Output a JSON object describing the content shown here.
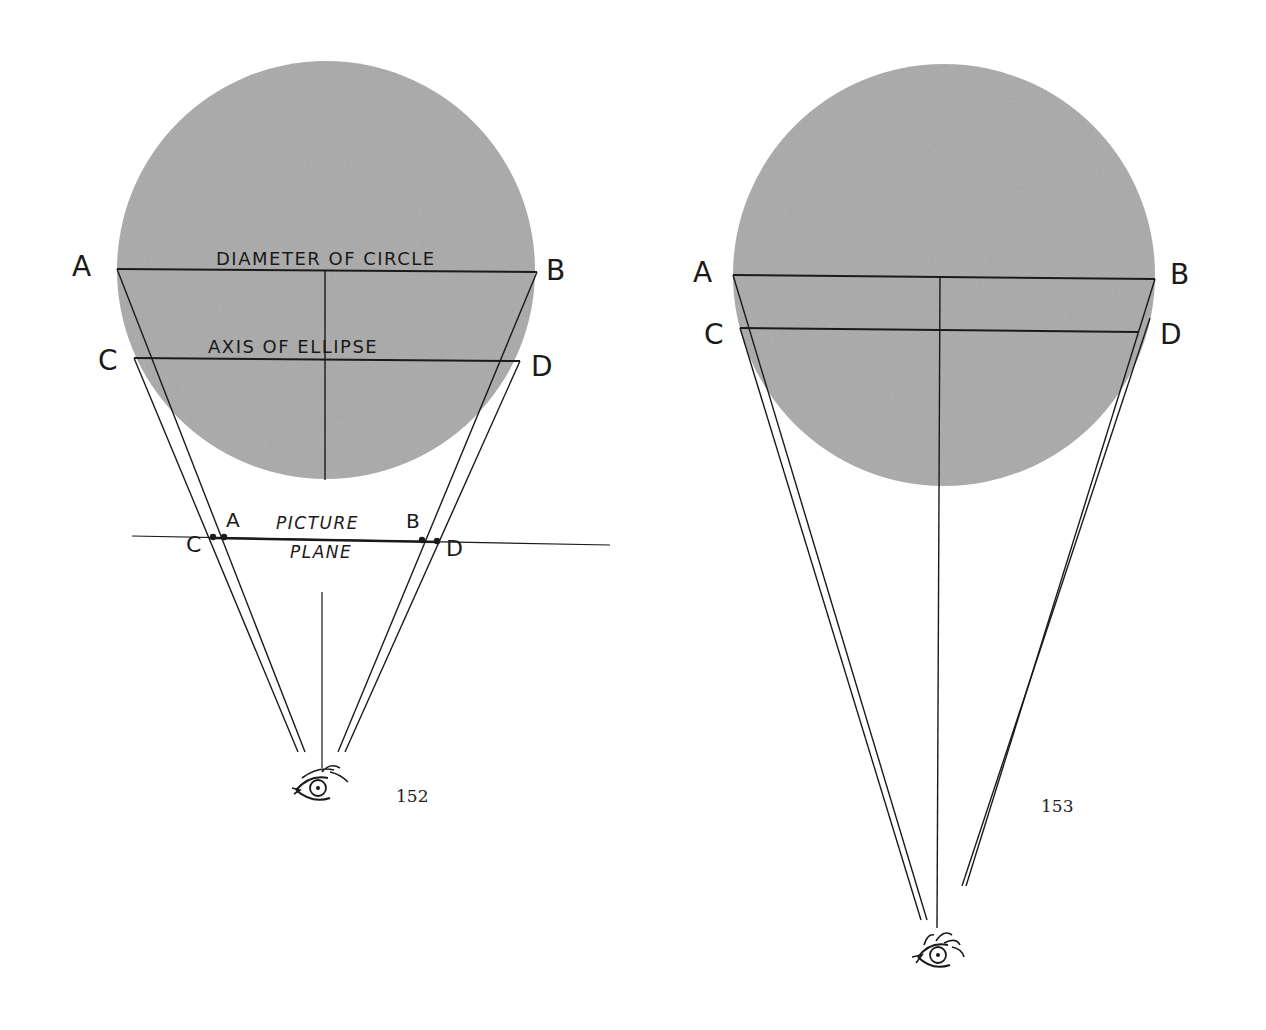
{
  "colors": {
    "background": "#ffffff",
    "disc_fill": "#a9a9a9",
    "ink": "#1a1a1a"
  },
  "figures": [
    {
      "number": "152",
      "labels": {
        "top_left": "A",
        "top_right": "B",
        "mid_left": "C",
        "mid_right": "D",
        "diameter": "DIAMETER OF CIRCLE",
        "axis": "AXIS OF ELLIPSE",
        "plane_A": "A",
        "plane_B": "B",
        "plane_C": "C",
        "plane_D": "D",
        "picture": "PICTURE",
        "plane": "PLANE"
      },
      "eye_icon": "eye-icon"
    },
    {
      "number": "153",
      "labels": {
        "top_left": "A",
        "top_right": "B",
        "mid_left": "C",
        "mid_right": "D"
      },
      "eye_icon": "eye-icon"
    }
  ]
}
